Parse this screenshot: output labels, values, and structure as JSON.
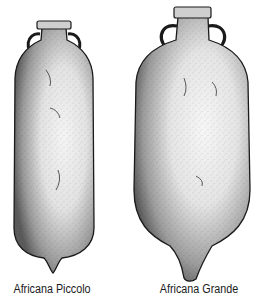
{
  "figure": {
    "items": [
      {
        "label": "Africana Piccolo"
      },
      {
        "label": "Africana Grande"
      }
    ]
  },
  "colors": {
    "ink": "#1a1a1a",
    "background": "#ffffff"
  }
}
